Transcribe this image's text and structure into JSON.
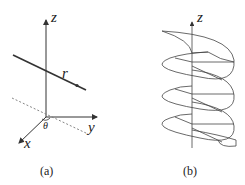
{
  "figure_a": {
    "caption": "(a)",
    "axes": {
      "z": "z",
      "y": "y",
      "x": "x"
    },
    "line_label": "r",
    "angle_label": "θ"
  },
  "figure_b": {
    "caption": "(b)",
    "axis_label": "z"
  },
  "colors": {
    "stroke": "#333333",
    "dashed": "#777777"
  }
}
